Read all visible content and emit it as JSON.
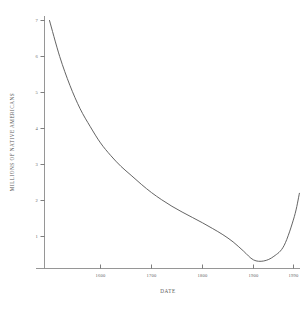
{
  "chart_data": {
    "type": "line",
    "title": "",
    "xlabel": "DATE",
    "ylabel": "MILLIONS OF NATIVE AMERICANS",
    "xlim": [
      1492,
      2000
    ],
    "ylim": [
      0,
      7.3
    ],
    "grid": false,
    "legend": null,
    "xticks": [
      1600,
      1700,
      1800,
      1900,
      1990
    ],
    "xtick_labels": [
      "1600",
      "1700",
      "1800",
      "1900",
      "1990"
    ],
    "yticks": [
      1,
      2,
      3,
      4,
      5,
      6,
      7
    ],
    "ytick_labels": [
      "1",
      "2",
      "3",
      "4",
      "5",
      "6",
      "7"
    ],
    "series": [
      {
        "name": "Native American population",
        "x": [
          1500,
          1520,
          1540,
          1560,
          1580,
          1600,
          1620,
          1640,
          1660,
          1680,
          1700,
          1720,
          1740,
          1760,
          1780,
          1800,
          1820,
          1840,
          1860,
          1880,
          1900,
          1920,
          1940,
          1960,
          1980,
          1990
        ],
        "values": [
          7.0,
          6.0,
          5.2,
          4.55,
          4.05,
          3.6,
          3.25,
          2.95,
          2.7,
          2.45,
          2.22,
          2.02,
          1.84,
          1.68,
          1.53,
          1.38,
          1.22,
          1.05,
          0.85,
          0.6,
          0.35,
          0.32,
          0.45,
          0.75,
          1.55,
          2.2
        ]
      }
    ],
    "annotations": []
  },
  "axis": {
    "x_label": "DATE",
    "y_label": "MILLIONS OF NATIVE AMERICANS"
  }
}
